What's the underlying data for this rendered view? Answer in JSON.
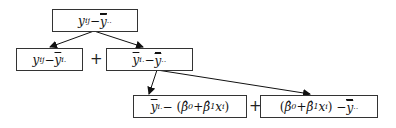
{
  "diagram": {
    "type": "tree-decomposition",
    "nodes": [
      {
        "id": "total",
        "label": "y_ij − ȳ̄..",
        "text": "y",
        "sub": "ij",
        "minus": " − ",
        "rhs": "y",
        "rhs_sub": ".."
      },
      {
        "id": "within",
        "label": "y_ij − ȳ_i.",
        "text": "y",
        "sub": "ij",
        "minus": " − ",
        "rhs": "y",
        "rhs_sub": "i."
      },
      {
        "id": "between",
        "label": "ȳ_i. − ȳ̄..",
        "text": "y",
        "sub": "i.",
        "minus": " − ",
        "rhs": "y",
        "rhs_sub": ".."
      },
      {
        "id": "lack-of-fit",
        "label": "ȳ_i. − (β̂0 + β̂1 x_i)",
        "text": "y",
        "sub": "i.",
        "minus": " − (",
        "b0": "β̂",
        "b0_sub": "0",
        "plus": " + ",
        "b1": "β̂",
        "b1_sub": "1",
        "x": "x",
        "x_sub": "i",
        "close": ")"
      },
      {
        "id": "regression",
        "label": "(β̂0 + β̂1 x_i) − ȳ̄..",
        "open": "(",
        "b0": "β̂",
        "b0_sub": "0",
        "plus": " + ",
        "b1": "β̂",
        "b1_sub": "1",
        "x": "x",
        "x_sub": "i",
        "close": ") − ",
        "rhs": "y",
        "rhs_sub": ".."
      }
    ],
    "operators": {
      "plus1": "+",
      "plus2": "+"
    },
    "edges": [
      {
        "from": "total",
        "to": "within"
      },
      {
        "from": "total",
        "to": "between"
      },
      {
        "from": "between",
        "to": "lack-of-fit"
      },
      {
        "from": "between",
        "to": "regression"
      }
    ]
  }
}
